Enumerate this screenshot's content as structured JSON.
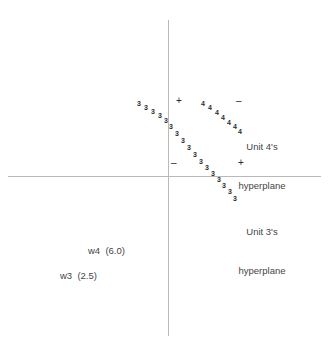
{
  "figure": {
    "title": "",
    "background_color": "#ffffff",
    "axis_color": "#b9b9b9",
    "marker_color": "#2b2b2b",
    "text_color": "#454545",
    "width": 335,
    "height": 344
  },
  "annotations": {
    "unit4": {
      "line1": "Unit 4's",
      "line2": "hyperplane"
    },
    "unit3": {
      "line1": "Unit 3's",
      "line2": "hyperplane"
    }
  },
  "weights": {
    "w4": "w4  (6.0)",
    "w3": "w3  (2.5)"
  },
  "signs": {
    "upper_left": "+",
    "upper_right": "–",
    "lower_left": "–",
    "lower_right": "+"
  },
  "chart_data": {
    "type": "scatter",
    "title": "",
    "xlabel": "",
    "ylabel": "",
    "grid": false,
    "legend": "none",
    "axes": {
      "origin_px": [
        168,
        176
      ],
      "x_axis_px": {
        "from": 8,
        "to": 321,
        "y": 176
      },
      "y_axis_px": {
        "from": 20,
        "to": 336,
        "x": 168
      }
    },
    "series": [
      {
        "name": "Unit 3 decision boundary samples",
        "marker_label": "3",
        "count": 17,
        "points_px": [
          [
            137,
            100
          ],
          [
            144,
            104
          ],
          [
            151,
            108
          ],
          [
            158,
            112
          ],
          [
            164,
            117
          ],
          [
            169,
            123
          ],
          [
            175,
            130
          ],
          [
            181,
            137
          ],
          [
            187,
            144
          ],
          [
            193,
            151
          ],
          [
            199,
            158
          ],
          [
            205,
            164
          ],
          [
            211,
            170
          ],
          [
            217,
            176
          ],
          [
            222,
            182
          ],
          [
            228,
            188
          ],
          [
            233,
            195
          ]
        ]
      },
      {
        "name": "Unit 4 decision boundary samples",
        "marker_label": "4",
        "count": 7,
        "points_px": [
          [
            201,
            100
          ],
          [
            208,
            104
          ],
          [
            215,
            109
          ],
          [
            221,
            114
          ],
          [
            227,
            119
          ],
          [
            233,
            123
          ],
          [
            238,
            128
          ]
        ]
      }
    ],
    "sign_markers": [
      {
        "label": "+",
        "px": [
          176,
          96
        ],
        "region": "upper-left"
      },
      {
        "label": "–",
        "px": [
          236,
          96
        ],
        "region": "upper-right"
      },
      {
        "label": "–",
        "px": [
          171,
          158
        ],
        "region": "lower-left"
      },
      {
        "label": "+",
        "px": [
          238,
          158
        ],
        "region": "lower-right"
      }
    ],
    "text_annotations": [
      {
        "text": "Unit 4's hyperplane",
        "px": [
          262,
          117
        ]
      },
      {
        "text": "Unit 3's hyperplane",
        "px": [
          262,
          202
        ]
      },
      {
        "text": "w4  (6.0)",
        "px": [
          88,
          247
        ]
      },
      {
        "text": "w3  (2.5)",
        "px": [
          60,
          272
        ]
      }
    ]
  }
}
